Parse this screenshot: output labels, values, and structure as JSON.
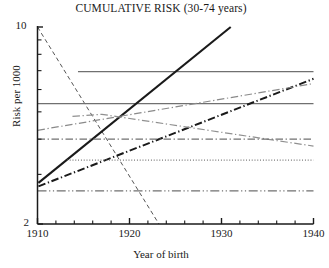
{
  "chart_data": {
    "type": "line",
    "title": "CUMULATIVE RISK (30-74 years)",
    "xlabel": "Year of birth",
    "ylabel": "Risk per 1000",
    "xlim": [
      1910,
      1940
    ],
    "ylim": [
      2,
      10
    ],
    "yscale": "log",
    "grid": false,
    "legend": "none",
    "xticks": [
      1910,
      1920,
      1930,
      1940
    ],
    "xtick_labels": [
      "1910",
      "1920",
      "1930",
      "1940"
    ],
    "xminor_step": 2,
    "yticks": [
      2,
      3,
      4,
      5,
      6,
      7,
      8,
      9,
      10
    ],
    "ytick_labels": {
      "top": "10",
      "bottom": "2"
    },
    "series": [
      {
        "name": "steep-decline-dashed",
        "style": "dashed",
        "color": "#555555",
        "width": 1.0,
        "x": [
          1910,
          1923.2
        ],
        "y": [
          10.0,
          2.0
        ]
      },
      {
        "name": "flat-high-solid",
        "style": "solid",
        "color": "#707070",
        "width": 1.2,
        "x": [
          1914.4,
          1940
        ],
        "y": [
          6.95,
          6.95
        ]
      },
      {
        "name": "flat-mid-solid",
        "style": "solid",
        "color": "#707070",
        "width": 1.2,
        "x": [
          1910,
          1940
        ],
        "y": [
          5.35,
          5.35
        ]
      },
      {
        "name": "rising-thick-solid-black",
        "style": "solid",
        "color": "#1a1a1a",
        "width": 2.1,
        "x": [
          1910.1,
          1931.0
        ],
        "y": [
          2.8,
          10.0
        ]
      },
      {
        "name": "rising-thick-dashdot-black",
        "style": "dashdot",
        "color": "#1a1a1a",
        "width": 2.0,
        "x": [
          1910.1,
          1940
        ],
        "y": [
          2.72,
          6.55
        ]
      },
      {
        "name": "rising-grey-dashdot",
        "style": "dashdot",
        "color": "#8a8a8a",
        "width": 1.2,
        "x": [
          1910,
          1940
        ],
        "y": [
          4.3,
          6.3
        ]
      },
      {
        "name": "arch-grey-dashdot",
        "style": "dashdot",
        "color": "#909090",
        "width": 1.2,
        "x": [
          1913.8,
          1917.0,
          1940
        ],
        "y": [
          4.82,
          4.9,
          3.78
        ]
      },
      {
        "name": "flat-low-dashdot",
        "style": "dashdot",
        "color": "#707070",
        "width": 1.3,
        "x": [
          1910,
          1940
        ],
        "y": [
          4.0,
          4.0
        ]
      },
      {
        "name": "flat-dotted",
        "style": "dotted",
        "color": "#6a6a6a",
        "width": 1.1,
        "x": [
          1913.2,
          1940
        ],
        "y": [
          3.37,
          3.37
        ]
      },
      {
        "name": "flat-bottom-dashdotdot",
        "style": "dashdotdot",
        "color": "#707070",
        "width": 1.3,
        "x": [
          1910,
          1940
        ],
        "y": [
          2.62,
          2.62
        ]
      }
    ]
  },
  "axes": {
    "frame_color": "#1a1a1a",
    "background": "#ffffff"
  }
}
